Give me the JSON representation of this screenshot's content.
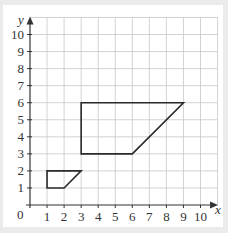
{
  "chart_data": {
    "type": "coordinate-grid",
    "title": "",
    "xlabel": "x",
    "ylabel": "y",
    "xlim": [
      0,
      10
    ],
    "ylim": [
      0,
      10
    ],
    "grid": true,
    "x_ticks": [
      "1",
      "2",
      "3",
      "4",
      "5",
      "6",
      "7",
      "8",
      "9",
      "10"
    ],
    "y_ticks": [
      "1",
      "2",
      "3",
      "4",
      "5",
      "6",
      "7",
      "8",
      "9",
      "10"
    ],
    "origin_label": "0",
    "shapes": [
      {
        "name": "small-trapezium",
        "vertices": [
          [
            1,
            1
          ],
          [
            1,
            2
          ],
          [
            3,
            2
          ],
          [
            2,
            1
          ]
        ]
      },
      {
        "name": "large-trapezium",
        "vertices": [
          [
            3,
            3
          ],
          [
            3,
            6
          ],
          [
            9,
            6
          ],
          [
            6,
            3
          ]
        ]
      }
    ]
  },
  "colors": {
    "background": "#ebebeb",
    "panel": "#ffffff",
    "grid": "#c8c8c8",
    "axis": "#333333",
    "shape": "#2a2a2a"
  }
}
